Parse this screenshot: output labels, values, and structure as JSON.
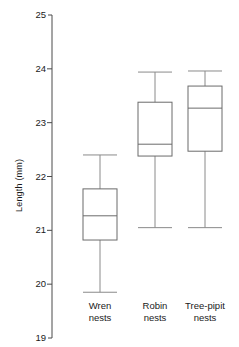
{
  "chart_data": {
    "type": "box",
    "title": "",
    "xlabel": "",
    "ylabel": "Length (mm)",
    "ylim": [
      19,
      25
    ],
    "yticks": [
      19,
      20,
      21,
      22,
      23,
      24,
      25
    ],
    "ytick_labels": [
      "19",
      "20",
      "21",
      "22",
      "23",
      "24",
      "25"
    ],
    "grid": false,
    "legend": "none",
    "categories": [
      "Wren\nnests",
      "Robin\nnests",
      "Tree-pipit\nnests"
    ],
    "category_labels": [
      "Wren nests",
      "Robin nests",
      "Tree-pipit nests"
    ],
    "boxes": [
      {
        "name": "Wren nests",
        "whisker_low": 19.85,
        "q1": 20.82,
        "median": 21.27,
        "q3": 21.77,
        "whisker_high": 22.4
      },
      {
        "name": "Robin nests",
        "whisker_low": 21.05,
        "q1": 22.38,
        "median": 22.6,
        "q3": 23.38,
        "whisker_high": 23.94
      },
      {
        "name": "Tree-pipit nests",
        "whisker_low": 21.05,
        "q1": 22.47,
        "median": 23.27,
        "q3": 23.68,
        "whisker_high": 23.96
      }
    ],
    "colors": {
      "axis": "#4a4a4a",
      "box_outline": "#6b6b6b",
      "whisker": "#8a8a8a",
      "background": "#ffffff",
      "text": "#1a1a1a"
    }
  }
}
